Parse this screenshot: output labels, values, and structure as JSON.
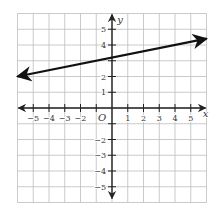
{
  "chart_data": {
    "type": "line",
    "title": "",
    "xlabel": "x",
    "ylabel": "y",
    "origin_label": "O",
    "xlim": [
      -6,
      6
    ],
    "ylim": [
      -6,
      6
    ],
    "grid": true,
    "x_tick_labels": [
      "-5",
      "-4",
      "-3",
      "-2",
      "1",
      "2",
      "3",
      "4",
      "5"
    ],
    "y_tick_labels": [
      "5",
      "4",
      "2",
      "1",
      "-2",
      "-3",
      "-4",
      "-5"
    ],
    "series": [
      {
        "name": "line",
        "equation": "y = 0.2x + 3.2",
        "x": [
          -6,
          6
        ],
        "y": [
          2.0,
          4.4
        ],
        "arrows_both_ends": true
      }
    ]
  },
  "colors": {
    "grid": "#bdbdbd",
    "axes": "#222222",
    "line": "#111111",
    "text": "#333333"
  },
  "figure_label": ""
}
